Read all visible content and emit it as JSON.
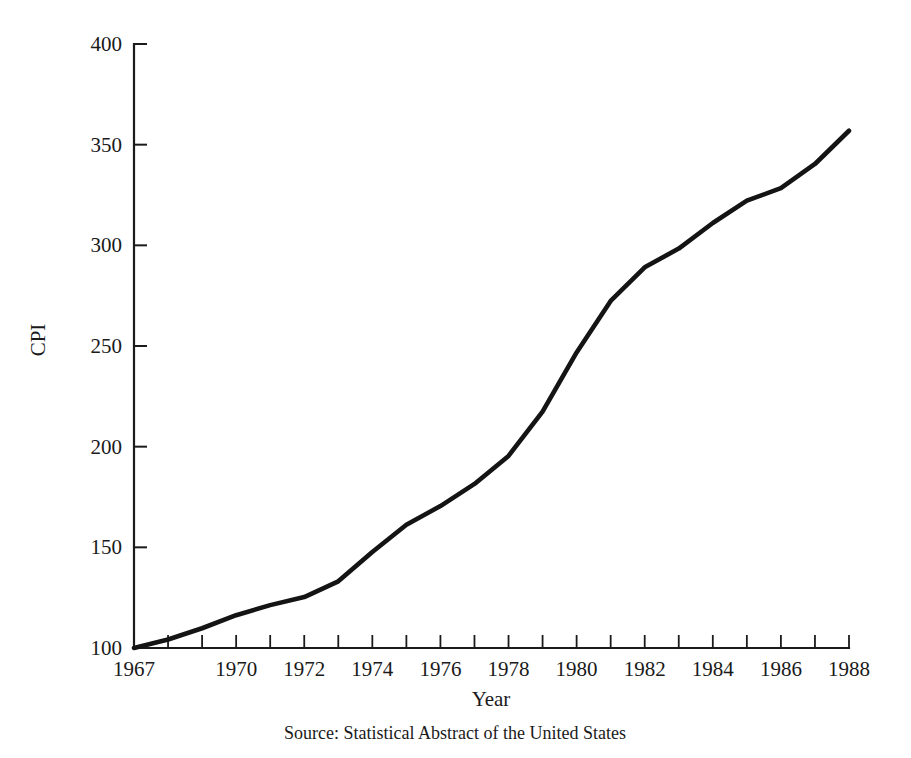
{
  "chart_data": {
    "type": "line",
    "title": "",
    "xlabel": "Year",
    "ylabel": "CPI",
    "source": "Source:  Statistical Abstract of the United States",
    "grid": false,
    "legend": "none",
    "xlim": [
      1967,
      1988
    ],
    "ylim": [
      100,
      400
    ],
    "y_ticks": [
      100,
      150,
      200,
      250,
      300,
      350,
      400
    ],
    "y_tick_labels": [
      "100",
      "150",
      "200",
      "250",
      "300",
      "350",
      "400"
    ],
    "x_ticks": [
      1967,
      1968,
      1969,
      1970,
      1971,
      1972,
      1973,
      1974,
      1975,
      1976,
      1977,
      1978,
      1979,
      1980,
      1981,
      1982,
      1983,
      1984,
      1985,
      1986,
      1987,
      1988
    ],
    "x_tick_labels_shown": [
      "1967",
      "1970",
      "1972",
      "1974",
      "1976",
      "1978",
      "1980",
      "1982",
      "1984",
      "1986",
      "1988"
    ],
    "x": [
      1967,
      1968,
      1969,
      1970,
      1971,
      1972,
      1973,
      1974,
      1975,
      1976,
      1977,
      1978,
      1979,
      1980,
      1981,
      1982,
      1983,
      1984,
      1985,
      1986,
      1987,
      1988
    ],
    "values": [
      100.0,
      104.2,
      109.8,
      116.3,
      121.3,
      125.3,
      133.1,
      147.7,
      161.2,
      170.5,
      181.5,
      195.4,
      217.4,
      246.8,
      272.4,
      289.1,
      298.4,
      311.1,
      322.2,
      328.4,
      340.4,
      356.9
    ],
    "series": [
      {
        "name": "CPI",
        "values": [
          100.0,
          104.2,
          109.8,
          116.3,
          121.3,
          125.3,
          133.1,
          147.7,
          161.2,
          170.5,
          181.5,
          195.4,
          217.4,
          246.8,
          272.4,
          289.1,
          298.4,
          311.1,
          322.2,
          328.4,
          340.4,
          356.9
        ],
        "color": "#141414"
      }
    ]
  },
  "colors": {
    "line": "#141414",
    "axis": "#1b1b1b",
    "text": "#1a1a1a",
    "background": "#ffffff"
  }
}
